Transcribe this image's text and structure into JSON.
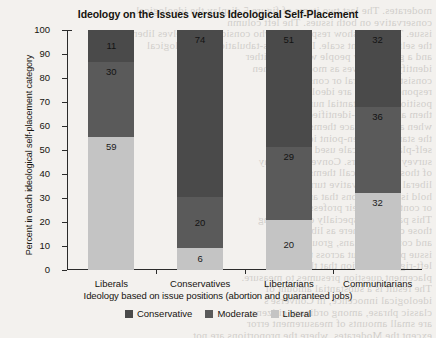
{
  "chart_data": {
    "type": "bar",
    "stacked": true,
    "title": "Ideology on the Issues versus Ideological Self-Placement",
    "xlabel": "Ideology based on issue positions (abortion and guaranteed jobs)",
    "ylabel": "Percent in each ideological self-placement category",
    "categories": [
      "Liberals",
      "Conservatives",
      "Libertarians",
      "Communitarians"
    ],
    "series": [
      {
        "name": "Conservative",
        "color": "#4a4a4a",
        "values": [
          11,
          74,
          51,
          32
        ]
      },
      {
        "name": "Moderate",
        "color": "#5a5a5a",
        "values": [
          30,
          20,
          29,
          36
        ]
      },
      {
        "name": "Liberal",
        "color": "#c4c4c4",
        "values": [
          59,
          6,
          20,
          32
        ]
      }
    ],
    "ylim": [
      0,
      100
    ],
    "yticks": [
      0,
      10,
      20,
      30,
      40,
      50,
      60,
      70,
      80,
      90,
      100
    ],
    "ytick_labels": [
      "0",
      "10",
      "20",
      "30",
      "40",
      "50",
      "60",
      "70",
      "80",
      "90",
      "100"
    ],
    "grid": false,
    "legend_position": "bottom"
  },
  "legend": {
    "items": [
      {
        "label": "Conservative",
        "color": "#4a4a4a"
      },
      {
        "label": "Moderate",
        "color": "#5a5a5a"
      },
      {
        "label": "Liberal",
        "color": "#c4c4c4"
      }
    ]
  },
  "ghost_text": {
    "lines": [
      "moderates. The last two items of figure 5 display the ideological",
      "conservative on both issues. The left column",
      "issue. The rows show respondents who consider themselves liberal",
      "the self-placement scale. It is a cross-tabulation of ideological",
      "and a great many people who are neither",
      "identify themselves as moderates when",
      "consistently liberal or conservative",
      "respondents who are ideologically",
      "positions, a substantial number of",
      "them are not self-identified as such",
      "when asked to place themselves on",
      "the standard seven-point ideological",
      "self-placement scale used by most",
      "survey researchers. Conversely, many",
      "of those who do call themselves",
      "liberal or conservative turn out to",
      "hold issue positions that are mixed",
      "or contrary to their professed label.",
      "This pattern is especially clear among",
      "those classified here as libertarians",
      "and communitarians, groups whose",
      "issue positions cut across the single",
      "left-right dimension that the self-",
      "placement question presumes to measure.",
      "The result is a substantial amount of",
      "ideological innocence, in Converse's",
      "classic phrase, among ordinary citizens.",
      "are small amounts of measurement error",
      "except the Moderates, where the proportions are not"
    ]
  }
}
